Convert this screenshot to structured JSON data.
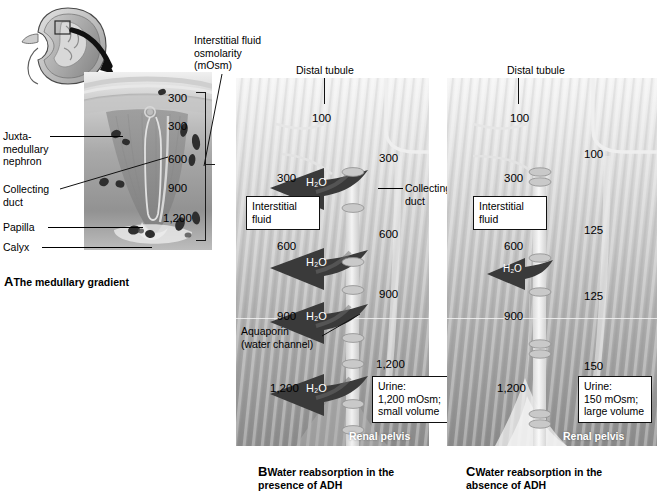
{
  "figure": {
    "domain": "anatomical-diagram"
  },
  "panelA": {
    "caption_letter": "A",
    "caption_text": "The medullary gradient",
    "labels": [
      {
        "id": "juxtamedullary-nephron",
        "text": "Juxta-\nmedullary\nnephron"
      },
      {
        "id": "collecting-duct",
        "text": "Collecting\nduct"
      },
      {
        "id": "papilla",
        "text": "Papilla"
      },
      {
        "id": "calyx",
        "text": "Calyx"
      }
    ],
    "scale_title": "Interstitial fluid\nosmolarity\n(mOsm)",
    "scale_values": [
      "300",
      "300",
      "600",
      "900",
      "1,200"
    ]
  },
  "panelB": {
    "caption_letter": "B",
    "caption_text": "Water reabsorption in the\n    presence of ADH",
    "distal_tubule_label": "Distal tubule",
    "distal_tubule_value": "100",
    "collecting_duct_label": "Collecting\nduct",
    "interstitial_box": "Interstitial\nfluid",
    "aquaporin_label": "Aquaporin\n(water channel)",
    "interstitial_values": [
      "300",
      "600",
      "900",
      "1,200"
    ],
    "tubule_values": [
      "300",
      "600",
      "900",
      "1,200"
    ],
    "water_arrow_label": "H₂O",
    "water_arrow_count": 4,
    "urine_box": "Urine:\n1,200 mOsm;\nsmall volume",
    "renal_pelvis_label": "Renal pelvis"
  },
  "panelC": {
    "caption_letter": "C",
    "caption_text": "Water reabsorption in the\n    absence of ADH",
    "distal_tubule_label": "Distal tubule",
    "distal_tubule_value": "100",
    "interstitial_box": "Interstitial\nfluid",
    "interstitial_values": [
      "300",
      "600",
      "900",
      "1,200"
    ],
    "tubule_values": [
      "100",
      "125",
      "125",
      "150"
    ],
    "water_arrow_label": "H₂O",
    "water_arrow_count": 1,
    "urine_box": "Urine:\n150 mOsm;\nlarge volume",
    "renal_pelvis_label": "Renal pelvis"
  },
  "colors": {
    "ink": "#111111",
    "arrow_dark": "#3a3a3a",
    "panel_light": "#e9e9e9",
    "panel_dark": "#8d8d8d",
    "aquaporin": "#c9c9c9"
  }
}
